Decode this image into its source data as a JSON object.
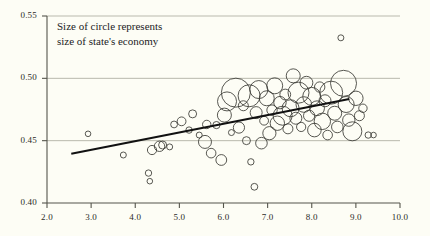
{
  "chart_data": {
    "type": "scatter",
    "title": "",
    "subtitle": "",
    "xlabel": "",
    "ylabel": "",
    "xlim": [
      2.0,
      10.0
    ],
    "ylim": [
      0.4,
      0.55
    ],
    "xticks": [
      "2.0",
      "3.0",
      "4.0",
      "5.0",
      "6.0",
      "7.0",
      "8.0",
      "9.0",
      "10.0"
    ],
    "xtick_values": [
      2.0,
      3.0,
      4.0,
      5.0,
      6.0,
      7.0,
      8.0,
      9.0,
      10.0
    ],
    "yticks": [
      "0.40",
      "0.45",
      "0.50",
      "0.55"
    ],
    "ytick_values": [
      0.4,
      0.45,
      0.5,
      0.55
    ],
    "grid": true,
    "grid_axis": "y",
    "legend": "none",
    "annotations": [
      {
        "name": "size-note",
        "lines": [
          "Size of circle represents",
          "size of state's economy"
        ],
        "x": 2.9,
        "y": 0.542
      }
    ],
    "marker_style": "open-circle",
    "size_encodes": "size of state's economy",
    "series": [
      {
        "name": "states",
        "points": [
          {
            "x": 2.93,
            "y": 0.4555,
            "r": 2.8
          },
          {
            "x": 3.73,
            "y": 0.4385,
            "r": 3.0
          },
          {
            "x": 4.3,
            "y": 0.424,
            "r": 3.2
          },
          {
            "x": 4.33,
            "y": 0.4175,
            "r": 2.8
          },
          {
            "x": 4.38,
            "y": 0.4425,
            "r": 4.6
          },
          {
            "x": 4.55,
            "y": 0.4455,
            "r": 5.2
          },
          {
            "x": 4.62,
            "y": 0.4465,
            "r": 4.0
          },
          {
            "x": 4.78,
            "y": 0.445,
            "r": 3.0
          },
          {
            "x": 4.88,
            "y": 0.463,
            "r": 3.4
          },
          {
            "x": 5.05,
            "y": 0.4655,
            "r": 4.4
          },
          {
            "x": 5.22,
            "y": 0.4585,
            "r": 3.2
          },
          {
            "x": 5.3,
            "y": 0.4715,
            "r": 4.0
          },
          {
            "x": 5.45,
            "y": 0.4545,
            "r": 3.0
          },
          {
            "x": 5.58,
            "y": 0.449,
            "r": 6.5
          },
          {
            "x": 5.62,
            "y": 0.463,
            "r": 4.2
          },
          {
            "x": 5.72,
            "y": 0.44,
            "r": 4.8
          },
          {
            "x": 5.84,
            "y": 0.4625,
            "r": 3.6
          },
          {
            "x": 5.95,
            "y": 0.4345,
            "r": 5.4
          },
          {
            "x": 6.02,
            "y": 0.4705,
            "r": 7.0
          },
          {
            "x": 6.08,
            "y": 0.4815,
            "r": 9.5
          },
          {
            "x": 6.18,
            "y": 0.4565,
            "r": 3.0
          },
          {
            "x": 6.28,
            "y": 0.4885,
            "r": 14.5
          },
          {
            "x": 6.35,
            "y": 0.4605,
            "r": 5.6
          },
          {
            "x": 6.45,
            "y": 0.478,
            "r": 5.0
          },
          {
            "x": 6.52,
            "y": 0.45,
            "r": 4.0
          },
          {
            "x": 6.58,
            "y": 0.486,
            "r": 11.0
          },
          {
            "x": 6.62,
            "y": 0.433,
            "r": 3.2
          },
          {
            "x": 6.7,
            "y": 0.413,
            "r": 3.4
          },
          {
            "x": 6.74,
            "y": 0.4725,
            "r": 6.0
          },
          {
            "x": 6.8,
            "y": 0.491,
            "r": 9.0
          },
          {
            "x": 6.86,
            "y": 0.448,
            "r": 5.8
          },
          {
            "x": 6.92,
            "y": 0.466,
            "r": 4.4
          },
          {
            "x": 6.98,
            "y": 0.484,
            "r": 7.5
          },
          {
            "x": 7.04,
            "y": 0.456,
            "r": 6.6
          },
          {
            "x": 7.1,
            "y": 0.4745,
            "r": 5.2
          },
          {
            "x": 7.16,
            "y": 0.494,
            "r": 8.0
          },
          {
            "x": 7.22,
            "y": 0.464,
            "r": 7.2
          },
          {
            "x": 7.28,
            "y": 0.4805,
            "r": 6.2
          },
          {
            "x": 7.34,
            "y": 0.47,
            "r": 9.5
          },
          {
            "x": 7.4,
            "y": 0.487,
            "r": 5.4
          },
          {
            "x": 7.46,
            "y": 0.4595,
            "r": 5.0
          },
          {
            "x": 7.52,
            "y": 0.476,
            "r": 8.5
          },
          {
            "x": 7.58,
            "y": 0.502,
            "r": 7.0
          },
          {
            "x": 7.64,
            "y": 0.468,
            "r": 6.0
          },
          {
            "x": 7.7,
            "y": 0.4885,
            "r": 10.5
          },
          {
            "x": 7.76,
            "y": 0.461,
            "r": 4.6
          },
          {
            "x": 7.82,
            "y": 0.479,
            "r": 7.8
          },
          {
            "x": 7.88,
            "y": 0.4965,
            "r": 6.4
          },
          {
            "x": 7.94,
            "y": 0.47,
            "r": 5.6
          },
          {
            "x": 8.0,
            "y": 0.4855,
            "r": 9.0
          },
          {
            "x": 8.06,
            "y": 0.4585,
            "r": 6.8
          },
          {
            "x": 8.12,
            "y": 0.476,
            "r": 7.4
          },
          {
            "x": 8.18,
            "y": 0.493,
            "r": 5.2
          },
          {
            "x": 8.24,
            "y": 0.4655,
            "r": 8.2
          },
          {
            "x": 8.3,
            "y": 0.482,
            "r": 6.0
          },
          {
            "x": 8.36,
            "y": 0.4545,
            "r": 4.8
          },
          {
            "x": 8.44,
            "y": 0.4885,
            "r": 11.5
          },
          {
            "x": 8.52,
            "y": 0.472,
            "r": 7.0
          },
          {
            "x": 8.58,
            "y": 0.461,
            "r": 5.8
          },
          {
            "x": 8.66,
            "y": 0.5325,
            "r": 3.0
          },
          {
            "x": 8.72,
            "y": 0.496,
            "r": 13.0
          },
          {
            "x": 8.78,
            "y": 0.479,
            "r": 8.0
          },
          {
            "x": 8.84,
            "y": 0.4665,
            "r": 6.2
          },
          {
            "x": 8.92,
            "y": 0.4575,
            "r": 9.5
          },
          {
            "x": 9.0,
            "y": 0.484,
            "r": 7.2
          },
          {
            "x": 9.08,
            "y": 0.47,
            "r": 5.0
          },
          {
            "x": 9.16,
            "y": 0.476,
            "r": 4.2
          },
          {
            "x": 9.28,
            "y": 0.4545,
            "r": 3.2
          },
          {
            "x": 9.4,
            "y": 0.4545,
            "r": 2.8
          }
        ]
      }
    ],
    "trendline": {
      "name": "fit-line",
      "x0": 2.55,
      "y0": 0.4395,
      "x1": 8.85,
      "y1": 0.4835
    },
    "colors": {
      "background": "#fdfdf5",
      "marker_stroke": "#3a3a34",
      "trendline": "#111111",
      "grid": "#b9b9ad",
      "axis": "#55554c",
      "text": "#23231f"
    }
  }
}
